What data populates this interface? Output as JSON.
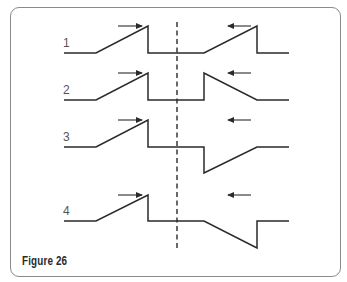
{
  "figure": {
    "caption": "Figure 26",
    "center_line": {
      "x": 177,
      "y1": 22,
      "y2": 249,
      "style": "dashed"
    },
    "rows": [
      {
        "label": "1",
        "label_pos": [
          63,
          47
        ],
        "baseline": 53,
        "left_arrow": {
          "direction": "right",
          "x1": 118,
          "x2": 142,
          "y": 26
        },
        "right_arrow": {
          "direction": "left",
          "x1": 251,
          "x2": 228,
          "y": 26
        },
        "path": "M64,53 L96,53 L148,26 L148,53 L204,53 L257,26 L257,53 L289,53"
      },
      {
        "label": "2",
        "label_pos": [
          63,
          94
        ],
        "baseline": 100,
        "left_arrow": {
          "direction": "right",
          "x1": 118,
          "x2": 142,
          "y": 73
        },
        "right_arrow": {
          "direction": "left",
          "x1": 251,
          "x2": 228,
          "y": 73
        },
        "path": "M64,100 L96,100 L148,73 L148,100 L204,100 L204,73 L257,100 L289,100"
      },
      {
        "label": "3",
        "label_pos": [
          63,
          141
        ],
        "baseline": 147,
        "left_arrow": {
          "direction": "right",
          "x1": 118,
          "x2": 142,
          "y": 120
        },
        "right_arrow": {
          "direction": "left",
          "x1": 251,
          "x2": 228,
          "y": 120
        },
        "path": "M64,147 L96,147 L148,120 L148,147 L204,147 L204,173 L257,147 L289,147"
      },
      {
        "label": "4",
        "label_pos": [
          63,
          215
        ],
        "baseline": 221,
        "left_arrow": {
          "direction": "right",
          "x1": 118,
          "x2": 142,
          "y": 195
        },
        "right_arrow": {
          "direction": "left",
          "x1": 251,
          "x2": 228,
          "y": 195
        },
        "path": "M64,221 L96,221 L148,195 L148,221 L204,221 L257,248 L257,221 L289,221"
      }
    ]
  },
  "colors": {
    "line": "#2a2a2a",
    "frame": "#8a8a8a",
    "label": "#555555",
    "background": "#ffffff"
  }
}
